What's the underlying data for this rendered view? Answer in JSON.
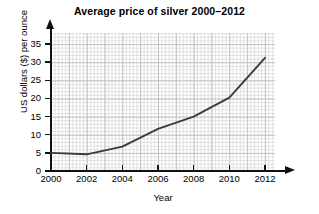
{
  "chart_data": {
    "type": "line",
    "title": "Average price of silver 2000–2012",
    "xlabel": "Year",
    "ylabel": "US dollars ($) per ounce",
    "x": [
      2000,
      2002,
      2004,
      2006,
      2008,
      2010,
      2012
    ],
    "values": [
      5.0,
      4.6,
      6.7,
      11.6,
      15.0,
      20.2,
      31.2
    ],
    "series": [
      {
        "name": "Average price of silver",
        "values": [
          5.0,
          4.6,
          6.7,
          11.6,
          15.0,
          20.2,
          31.2
        ]
      }
    ],
    "xlim": [
      2000,
      2012
    ],
    "ylim": [
      0,
      35
    ],
    "xticks": [
      "2000",
      "2002",
      "2004",
      "2006",
      "2008",
      "2010",
      "2012"
    ],
    "yticks": [
      "0",
      "5",
      "10",
      "15",
      "20",
      "25",
      "30",
      "35"
    ],
    "grid": true,
    "legend": false,
    "line_color": "#3b3b3b",
    "grid_color": "#dedede",
    "axis_color": "#111111"
  }
}
